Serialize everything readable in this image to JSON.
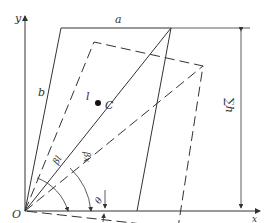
{
  "diagram": {
    "labels": {
      "a": "a",
      "b": "b",
      "l": "l",
      "C": "C",
      "O": "O",
      "x": "x",
      "y": "y",
      "sum_h": "∑h",
      "beta_l": "βl",
      "beta_x": "βx",
      "theta": "θ"
    },
    "colors": {
      "stroke": "#333333",
      "background": "#ffffff"
    }
  }
}
